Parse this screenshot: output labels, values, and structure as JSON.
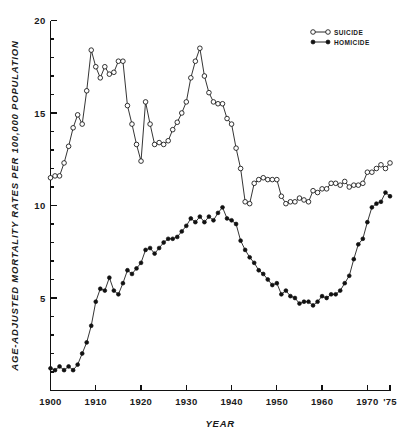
{
  "chart_data": {
    "type": "line",
    "title": "",
    "xlabel": "YEAR",
    "ylabel": "AGE-ADJUSTED MORTALITY RATES PER 100,000 POPULATION",
    "xlim": [
      1900,
      1975
    ],
    "ylim": [
      0,
      20
    ],
    "grid": false,
    "legend_position": "top-right",
    "x_ticks": [
      1900,
      1910,
      1920,
      1930,
      1940,
      1950,
      1960,
      1970,
      1975
    ],
    "x_tick_labels": [
      "1900",
      "1910",
      "1920",
      "1930",
      "1940",
      "1950",
      "1960",
      "1970",
      "'75"
    ],
    "y_ticks": [
      5,
      10,
      15,
      20
    ],
    "y_tick_labels": [
      "5",
      "10",
      "15",
      "20"
    ],
    "y_minor_tick_step": 1,
    "series": [
      {
        "name": "SUICIDE",
        "marker": "open-circle",
        "x": [
          1900,
          1901,
          1902,
          1903,
          1904,
          1905,
          1906,
          1907,
          1908,
          1909,
          1910,
          1911,
          1912,
          1913,
          1914,
          1915,
          1916,
          1917,
          1918,
          1919,
          1920,
          1921,
          1922,
          1923,
          1924,
          1925,
          1926,
          1927,
          1928,
          1929,
          1930,
          1931,
          1932,
          1933,
          1934,
          1935,
          1936,
          1937,
          1938,
          1939,
          1940,
          1941,
          1942,
          1943,
          1944,
          1945,
          1946,
          1947,
          1948,
          1949,
          1950,
          1951,
          1952,
          1953,
          1954,
          1955,
          1956,
          1957,
          1958,
          1959,
          1960,
          1961,
          1962,
          1963,
          1964,
          1965,
          1966,
          1967,
          1968,
          1969,
          1970,
          1971,
          1972,
          1973,
          1974,
          1975
        ],
        "values": [
          11.5,
          11.6,
          11.6,
          12.3,
          13.2,
          14.2,
          14.9,
          14.4,
          16.2,
          18.4,
          17.5,
          16.9,
          17.5,
          17.1,
          17.2,
          17.8,
          17.8,
          15.4,
          14.4,
          13.3,
          12.4,
          15.6,
          14.4,
          13.3,
          13.4,
          13.3,
          13.5,
          14.1,
          14.5,
          15.0,
          15.6,
          16.9,
          17.8,
          18.5,
          17.0,
          16.1,
          15.6,
          15.5,
          15.5,
          14.7,
          14.4,
          13.1,
          12.0,
          10.2,
          10.1,
          11.2,
          11.4,
          11.5,
          11.4,
          11.4,
          11.4,
          10.5,
          10.1,
          10.2,
          10.2,
          10.4,
          10.3,
          10.2,
          10.8,
          10.7,
          10.9,
          10.9,
          11.2,
          11.2,
          11.1,
          11.3,
          11.0,
          11.1,
          11.1,
          11.2,
          11.8,
          11.8,
          12.0,
          12.2,
          12.0,
          12.3
        ]
      },
      {
        "name": "HOMICIDE",
        "marker": "filled-circle",
        "x": [
          1900,
          1901,
          1902,
          1903,
          1904,
          1905,
          1906,
          1907,
          1908,
          1909,
          1910,
          1911,
          1912,
          1913,
          1914,
          1915,
          1916,
          1917,
          1918,
          1919,
          1920,
          1921,
          1922,
          1923,
          1924,
          1925,
          1926,
          1927,
          1928,
          1929,
          1930,
          1931,
          1932,
          1933,
          1934,
          1935,
          1936,
          1937,
          1938,
          1939,
          1940,
          1941,
          1942,
          1943,
          1944,
          1945,
          1946,
          1947,
          1948,
          1949,
          1950,
          1951,
          1952,
          1953,
          1954,
          1955,
          1956,
          1957,
          1958,
          1959,
          1960,
          1961,
          1962,
          1963,
          1964,
          1965,
          1966,
          1967,
          1968,
          1969,
          1970,
          1971,
          1972,
          1973,
          1974,
          1975
        ],
        "values": [
          1.2,
          1.1,
          1.3,
          1.1,
          1.3,
          1.1,
          1.4,
          2.0,
          2.6,
          3.5,
          4.8,
          5.5,
          5.4,
          6.1,
          5.4,
          5.2,
          5.8,
          6.5,
          6.3,
          6.6,
          6.9,
          7.6,
          7.7,
          7.4,
          7.7,
          8.0,
          8.2,
          8.2,
          8.3,
          8.6,
          8.9,
          9.3,
          9.1,
          9.4,
          9.1,
          9.4,
          9.2,
          9.6,
          9.9,
          9.3,
          9.2,
          9.0,
          8.1,
          7.6,
          7.2,
          6.9,
          6.5,
          6.3,
          6.0,
          5.7,
          5.8,
          5.2,
          5.4,
          5.1,
          5.0,
          4.7,
          4.8,
          4.8,
          4.6,
          4.8,
          5.1,
          5.0,
          5.2,
          5.2,
          5.4,
          5.8,
          6.2,
          7.1,
          7.9,
          8.2,
          9.1,
          9.9,
          10.1,
          10.2,
          10.7,
          10.5
        ]
      }
    ]
  },
  "legend": {
    "items": [
      {
        "label": "SUICIDE",
        "marker": "open-circle"
      },
      {
        "label": "HOMICIDE",
        "marker": "filled-circle"
      }
    ]
  },
  "axes": {
    "x_title": "YEAR",
    "y_title": "AGE-ADJUSTED MORTALITY RATES PER 100,000 POPULATION"
  },
  "colors": {
    "ink": "#111111",
    "background": "#ffffff"
  }
}
